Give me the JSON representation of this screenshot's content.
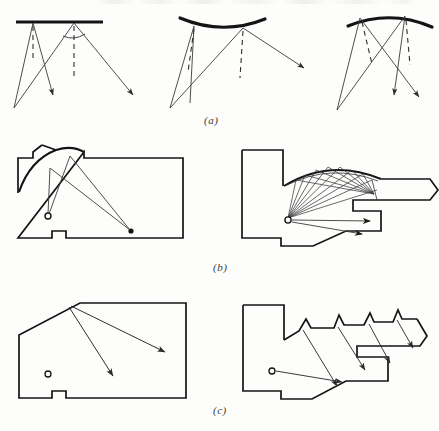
{
  "figure": {
    "background_color": "#fdfdfc",
    "ink_color": "#1a1a1a",
    "ray_color": "#3a3a3a",
    "panels": [
      {
        "id": "a",
        "label": "(a)",
        "description": "Sound reflection from flat, concave and convex reflector surfaces",
        "subpanels": [
          {
            "id": "a1",
            "reflector_shape": "flat",
            "reflector_thickness": 3,
            "source": {
              "x": 14,
              "y": 108
            },
            "reflector": {
              "x1": 16,
              "y1": 22,
              "x2": 103,
              "y2": 22,
              "curve": 0
            },
            "reflection_points": [
              {
                "x": 33,
                "y": 23
              },
              {
                "x": 74,
                "y": 23
              }
            ],
            "normals": [
              {
                "x1": 33,
                "y1": 25,
                "x2": 33,
                "y2": 62
              },
              {
                "x1": 74,
                "y1": 25,
                "x2": 74,
                "y2": 77
              }
            ],
            "incident_rays": [
              {
                "x1": 14,
                "y1": 108,
                "x2": 33,
                "y2": 23
              },
              {
                "x1": 14,
                "y1": 108,
                "x2": 74,
                "y2": 23
              }
            ],
            "reflected_rays": [
              {
                "x1": 33,
                "y1": 23,
                "x2": 53,
                "y2": 96
              },
              {
                "x1": 74,
                "y1": 23,
                "x2": 134,
                "y2": 96
              }
            ],
            "angle_arc": {
              "cx": 74,
              "cy": 23,
              "r": 18,
              "a1": 52,
              "a2": 90
            }
          },
          {
            "id": "a2",
            "reflector_shape": "concave",
            "reflector_thickness": 3,
            "source": {
              "x": 170,
              "y": 108
            },
            "reflector": {
              "x1": 180,
              "y1": 19,
              "x2": 265,
              "y2": 19,
              "curve": 11
            },
            "reflection_points": [
              {
                "x": 195,
                "y": 26
              },
              {
                "x": 243,
                "y": 28
              }
            ],
            "normals": [
              {
                "x1": 195,
                "y1": 29,
                "x2": 188,
                "y2": 72
              },
              {
                "x1": 243,
                "y1": 31,
                "x2": 240,
                "y2": 78
              }
            ],
            "incident_rays": [
              {
                "x1": 170,
                "y1": 108,
                "x2": 195,
                "y2": 26
              },
              {
                "x1": 170,
                "y1": 108,
                "x2": 243,
                "y2": 28
              }
            ],
            "reflected_rays": [
              {
                "x1": 195,
                "y1": 26,
                "x2": 190,
                "y2": 103
              },
              {
                "x1": 243,
                "y1": 28,
                "x2": 305,
                "y2": 68
              }
            ]
          },
          {
            "id": "a3",
            "reflector_shape": "convex",
            "reflector_thickness": 3,
            "source": {
              "x": 337,
              "y": 110
            },
            "reflector": {
              "x1": 348,
              "y1": 24,
              "x2": 432,
              "y2": 26,
              "curve": -10
            },
            "reflection_points": [
              {
                "x": 360,
                "y": 18
              },
              {
                "x": 405,
                "y": 15
              }
            ],
            "normals": [
              {
                "x1": 362,
                "y1": 22,
                "x2": 372,
                "y2": 64
              },
              {
                "x1": 406,
                "y1": 20,
                "x2": 410,
                "y2": 65
              }
            ],
            "incident_rays": [
              {
                "x1": 337,
                "y1": 110,
                "x2": 360,
                "y2": 18
              },
              {
                "x1": 337,
                "y1": 110,
                "x2": 405,
                "y2": 15
              }
            ],
            "reflected_rays": [
              {
                "x1": 360,
                "y1": 18,
                "x2": 420,
                "y2": 98
              },
              {
                "x1": 405,
                "y1": 15,
                "x2": 395,
                "y2": 96
              }
            ]
          }
        ]
      },
      {
        "id": "b",
        "label": "(b)",
        "description": "Curved and domed ceilings concentrate reflected sound into focal points",
        "subpanels": [
          {
            "id": "b1",
            "ceiling_shape": "domed-arc",
            "room_outline": "M18,193 L18,158 L33,158 L33,152 L42,145 L56,170 L72,157 L78,155 L84,159 L84,152 L183,152 L183,238 L53,238 L53,230 L38,230 L38,238 L18,238 Z",
            "ceiling_arc": {
              "x1": 20,
              "y1": 192,
              "x2": 78,
              "y2": 154,
              "bulge": 12
            },
            "source": {
              "x": 48,
              "y": 216,
              "radius": 3
            },
            "focus": {
              "x": 131,
              "y": 231
            },
            "rays": [
              {
                "from": {
                  "x": 48,
                  "y": 216
                },
                "via": {
                  "x": 50,
                  "y": 168
                },
                "to": {
                  "x": 131,
                  "y": 231
                }
              },
              {
                "from": {
                  "x": 48,
                  "y": 216
                },
                "via": {
                  "x": 70,
                  "y": 157
                },
                "to": {
                  "x": 131,
                  "y": 231
                }
              }
            ],
            "arrow_at_focus": true
          },
          {
            "id": "b2",
            "ceiling_shape": "curved-vault",
            "room_outline": "M242,150 L242,238 L281,238 L281,246 L312,246 L345,231 L381,231 L381,210 L353,210 L353,200 L431,200 L439,190 L431,178 L380,178 L367,172 L300,178 L283,186 L283,150 Z",
            "vault_arc": {
              "x1": 285,
              "y1": 185,
              "x2": 382,
              "y2": 181,
              "bulge": 14
            },
            "source": {
              "x": 288,
              "y": 219,
              "radius": 3
            },
            "fan_ray_count": 9,
            "fan_targets_on_vault": 9,
            "convergence_point": {
              "x": 374,
              "y": 194
            },
            "direct_arrows": [
              {
                "x1": 288,
                "y1": 219,
                "x2": 371,
                "y2": 221
              },
              {
                "x1": 288,
                "y1": 219,
                "x2": 363,
                "y2": 234
              }
            ]
          }
        ]
      },
      {
        "id": "c",
        "label": "(c)",
        "description": "Flat angled and sawtooth ceilings diffuse reflected sound evenly",
        "subpanels": [
          {
            "id": "c1",
            "ceiling_shape": "flat-angled",
            "room_outline": "M19,335 L19,385 L19,398 L52,398 L52,391 L66,391 L66,398 L186,398 L186,303 L80,303 L19,335 Z",
            "source": {
              "x": 48,
              "y": 374,
              "radius": 3
            },
            "reflection_point": {
              "x": 71,
              "y": 306
            },
            "reflected_rays": [
              {
                "x1": 71,
                "y1": 306,
                "x2": 166,
                "y2": 352
              },
              {
                "x1": 71,
                "y1": 306,
                "x2": 114,
                "y2": 377
              }
            ]
          },
          {
            "id": "c2",
            "ceiling_shape": "sawtooth",
            "room_outline": "M243,305 L243,391 L281,391 L281,399 L311,399 L345,381 L388,381 L388,356 L357,356 L357,345 L420,345 L427,335 L417,318 L402,318 L398,310 L393,322 L374,322 L370,313 L364,325 L344,325 L339,315 L334,328 L311,328 L306,319 L299,331 L284,340 L284,305 Z",
            "sawtooth_teeth": 4,
            "source": {
              "x": 272,
              "y": 371,
              "radius": 3
            },
            "direct_ray": {
              "x1": 272,
              "y1": 371,
              "x2": 343,
              "y2": 382
            },
            "diffuse_rays": [
              {
                "x1": 303,
                "y1": 330,
                "x2": 338,
                "y2": 387
              },
              {
                "x1": 339,
                "y1": 327,
                "x2": 366,
                "y2": 371
              },
              {
                "x1": 370,
                "y1": 324,
                "x2": 391,
                "y2": 364
              },
              {
                "x1": 398,
                "y1": 320,
                "x2": 414,
                "y2": 349
              }
            ]
          }
        ]
      }
    ]
  }
}
